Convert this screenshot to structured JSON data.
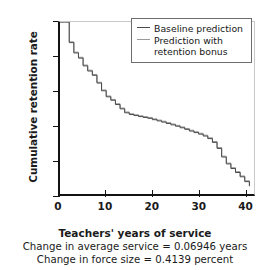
{
  "chart_data": {
    "type": "line",
    "title": "",
    "xlabel": "Teachers' years of service",
    "ylabel": "Cumulative retention rate",
    "xlim": [
      0,
      42
    ],
    "ylim": [
      0,
      1.0
    ],
    "xticks": [
      0,
      10,
      20,
      30,
      40
    ],
    "xtick_labels": [
      "0",
      "10",
      "20",
      "30",
      "40"
    ],
    "yticks": [
      0,
      0.2,
      0.4,
      0.6,
      0.8,
      1.0
    ],
    "ytick_labels": [
      "0",
      "0.2",
      "0.4",
      "0.6",
      "0.8",
      "1.0"
    ],
    "grid": false,
    "legend_position": "top-right",
    "drawstyle": "steps-post",
    "series": [
      {
        "name": "Baseline prediction",
        "color": "#4a4a4a",
        "x": [
          0,
          1,
          2,
          3,
          4,
          5,
          6,
          7,
          8,
          9,
          10,
          11,
          12,
          13,
          14,
          15,
          16,
          17,
          18,
          19,
          20,
          21,
          22,
          23,
          24,
          25,
          26,
          27,
          28,
          29,
          30,
          31,
          32,
          33,
          34,
          35,
          36,
          37,
          38,
          39,
          40,
          41
        ],
        "values": [
          1.0,
          1.0,
          0.88,
          0.82,
          0.79,
          0.745,
          0.715,
          0.69,
          0.645,
          0.6,
          0.565,
          0.545,
          0.52,
          0.495,
          0.472,
          0.462,
          0.456,
          0.45,
          0.445,
          0.44,
          0.432,
          0.425,
          0.418,
          0.41,
          0.402,
          0.394,
          0.385,
          0.376,
          0.366,
          0.357,
          0.348,
          0.337,
          0.322,
          0.3,
          0.265,
          0.215,
          0.175,
          0.148,
          0.125,
          0.1,
          0.072,
          0.045
        ]
      },
      {
        "name": "Prediction with retention bonus",
        "color": "#9a9a9a",
        "x": [
          0,
          1,
          2,
          3,
          4,
          5,
          6,
          7,
          8,
          9,
          10,
          11,
          12,
          13,
          14,
          15,
          16,
          17,
          18,
          19,
          20,
          21,
          22,
          23,
          24,
          25,
          26,
          27,
          28,
          29,
          30,
          31,
          32,
          33,
          34,
          35,
          36,
          37,
          38,
          39,
          40,
          41
        ],
        "values": [
          1.0,
          1.0,
          0.885,
          0.825,
          0.795,
          0.75,
          0.72,
          0.695,
          0.65,
          0.605,
          0.57,
          0.55,
          0.525,
          0.5,
          0.477,
          0.467,
          0.461,
          0.455,
          0.45,
          0.445,
          0.437,
          0.43,
          0.423,
          0.415,
          0.407,
          0.399,
          0.39,
          0.381,
          0.371,
          0.362,
          0.353,
          0.342,
          0.327,
          0.305,
          0.27,
          0.22,
          0.18,
          0.153,
          0.13,
          0.105,
          0.077,
          0.05
        ]
      }
    ],
    "annotations": [
      "Change in average service = 0.06946 years",
      "Change in force size = 0.4139 percent"
    ]
  },
  "legend": {
    "items": [
      {
        "label": "Baseline prediction"
      },
      {
        "label": "Prediction with\nretention bonus"
      }
    ]
  },
  "captions": {
    "xlabel": "Teachers' years of service",
    "note1": "Change in average service = 0.06946 years",
    "note2": "Change in force size = 0.4139 percent"
  },
  "colors": {
    "axis": "#121212",
    "baseline_series": "#4a4a4a",
    "bonus_series": "#9a9a9a",
    "legend_border": "#6d6d6d"
  }
}
